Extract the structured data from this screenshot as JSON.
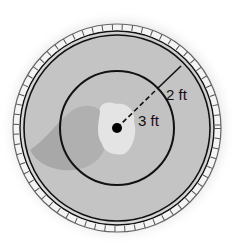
{
  "diagram": {
    "type": "concentric-circles",
    "labels": {
      "inner_radius": "3 ft",
      "ring_width": "2 ft"
    },
    "measurements": {
      "inner_radius_ft": 3,
      "ring_width_ft": 2,
      "outer_radius_ft": 5
    },
    "colors": {
      "background": "#ffffff",
      "halo": "#c9c9c9",
      "fill": "#c4c4c4",
      "shadow_patch": "#a9a9a9",
      "light_patch": "#e6e6e6",
      "stroke": "#111111"
    }
  }
}
